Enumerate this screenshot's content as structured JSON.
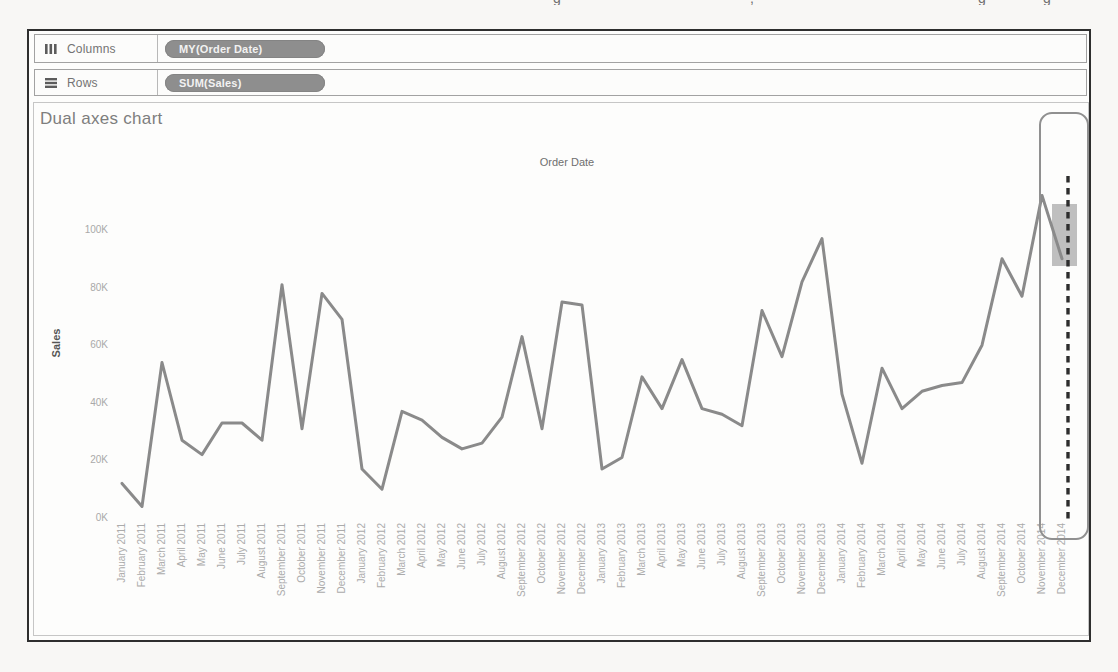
{
  "page_artifacts": {
    "fragments": [
      {
        "x": 553,
        "glyph": "g"
      },
      {
        "x": 750,
        "glyph": ","
      },
      {
        "x": 978,
        "glyph": "g"
      },
      {
        "x": 1043,
        "glyph": "g"
      }
    ]
  },
  "shelves": {
    "columns": {
      "label": "Columns",
      "pill": "MY(Order Date)"
    },
    "rows": {
      "label": "Rows",
      "pill": "SUM(Sales)"
    }
  },
  "chart": {
    "title": "Dual axes chart",
    "x_axis_title": "Order Date",
    "y_axis_title": "Sales",
    "y_ticks": [
      "0K",
      "20K",
      "40K",
      "60K",
      "80K",
      "100K"
    ]
  },
  "chart_data": {
    "type": "line",
    "title": "Dual axes chart",
    "xlabel": "Order Date",
    "ylabel": "Sales",
    "units": "thousands (K)",
    "ylim": [
      0,
      115
    ],
    "grid": false,
    "legend": false,
    "x": [
      "January 2011",
      "February 2011",
      "March 2011",
      "April 2011",
      "May 2011",
      "June 2011",
      "July 2011",
      "August 2011",
      "September 2011",
      "October 2011",
      "November 2011",
      "December 2011",
      "January 2012",
      "February 2012",
      "March 2012",
      "April 2012",
      "May 2012",
      "June 2012",
      "July 2012",
      "August 2012",
      "September 2012",
      "October 2012",
      "November 2012",
      "December 2012",
      "January 2013",
      "February 2013",
      "March 2013",
      "April 2013",
      "May 2013",
      "June 2013",
      "July 2013",
      "August 2013",
      "September 2013",
      "October 2013",
      "November 2013",
      "December 2013",
      "January 2014",
      "February 2014",
      "March 2014",
      "April 2014",
      "May 2014",
      "June 2014",
      "July 2014",
      "August 2014",
      "September 2014",
      "October 2014",
      "November 2014",
      "December 2014"
    ],
    "values_k": [
      12,
      4,
      54,
      27,
      22,
      33,
      33,
      27,
      81,
      31,
      78,
      69,
      17,
      10,
      37,
      34,
      28,
      24,
      26,
      35,
      63,
      31,
      75,
      74,
      17,
      21,
      49,
      38,
      55,
      38,
      36,
      32,
      72,
      56,
      82,
      97,
      43,
      19,
      52,
      38,
      44,
      46,
      47,
      60,
      90,
      77,
      112,
      90
    ]
  },
  "annotations": {
    "highlighted_month": "December 2014",
    "elements": [
      "column-highlight-outline",
      "vertical-dashed-reference-line",
      "selected-mark-highlight-box"
    ]
  },
  "colors": {
    "line": "#8a8a8a",
    "pill_bg": "#8e8e8e",
    "pill_text": "#f2f2f2",
    "tick_text": "#ababab",
    "border_dark": "#2e2e2e",
    "highlight_box": "#bfbfbf",
    "dashed_line": "#2d2d2d"
  }
}
